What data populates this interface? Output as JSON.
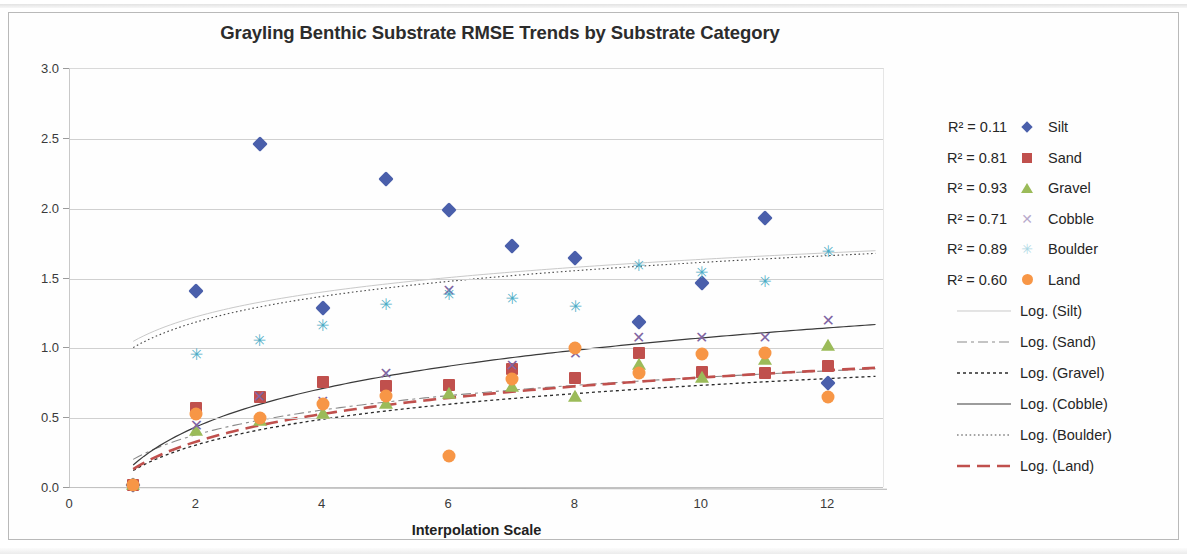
{
  "chart_data": {
    "type": "scatter",
    "title": "Grayling Benthic Substrate RMSE Trends by Substrate Category",
    "xlabel": "Interpolation Scale",
    "ylabel": "RMSE",
    "xlim": [
      0,
      12.9
    ],
    "ylim": [
      0.0,
      3.0
    ],
    "ytick_labels": [
      "0.0",
      "0.5",
      "1.0",
      "1.5",
      "2.0",
      "2.5",
      "3.0"
    ],
    "ytick_values": [
      0.0,
      0.5,
      1.0,
      1.5,
      2.0,
      2.5,
      3.0
    ],
    "xtick_labels": [
      "0",
      "2",
      "4",
      "6",
      "8",
      "10",
      "12"
    ],
    "xtick_values": [
      0,
      2,
      4,
      6,
      8,
      10,
      12
    ],
    "grid": true,
    "legend_position": "right",
    "x": [
      1,
      2,
      3,
      4,
      5,
      6,
      7,
      8,
      9,
      10,
      11,
      12
    ],
    "series": [
      {
        "name": "Silt",
        "marker": "diamond",
        "color": "#4A5FAB",
        "r2": "0.11",
        "r2_label": "R² = 0.11",
        "trend_label": "Log. (Silt)",
        "trend_style": "thin-solid-light",
        "trend_color": "#c9c9c9",
        "values": [
          0.02,
          1.41,
          2.46,
          1.29,
          2.21,
          1.99,
          1.73,
          1.65,
          1.19,
          1.47,
          1.93,
          0.75
        ]
      },
      {
        "name": "Sand",
        "marker": "square",
        "color": "#C0504D",
        "r2": "0.81",
        "r2_label": "R² = 0.81",
        "trend_label": "Log. (Sand)",
        "trend_style": "dash-dot",
        "trend_color": "#8a8a8a",
        "values": [
          0.02,
          0.57,
          0.65,
          0.76,
          0.73,
          0.74,
          0.85,
          0.79,
          0.97,
          0.83,
          0.82,
          0.87
        ]
      },
      {
        "name": "Gravel",
        "marker": "triangle",
        "color": "#9BBB59",
        "r2": "0.93",
        "r2_label": "R² = 0.93",
        "trend_label": "Log. (Gravel)",
        "trend_style": "dotted-dark",
        "trend_color": "#2b2b2b",
        "values": [
          0.02,
          0.41,
          0.48,
          0.53,
          0.6,
          0.67,
          0.72,
          0.65,
          0.88,
          0.79,
          0.92,
          1.02
        ]
      },
      {
        "name": "Cobble",
        "marker": "x",
        "color": "#8064A2",
        "r2": "0.71",
        "r2_label": "R² = 0.71",
        "trend_label": "Log. (Cobble)",
        "trend_style": "solid-dark",
        "trend_color": "#3a3a3a",
        "values": [
          0.02,
          0.45,
          0.66,
          0.62,
          0.82,
          1.42,
          0.88,
          0.97,
          1.08,
          1.08,
          1.08,
          1.2
        ]
      },
      {
        "name": "Boulder",
        "marker": "star",
        "color": "#4BACC6",
        "r2": "0.89",
        "r2_label": "R² = 0.89",
        "trend_label": "Log. (Boulder)",
        "trend_style": "fine-dotted",
        "trend_color": "#4a4a4a",
        "values": [
          0.02,
          0.96,
          1.06,
          1.17,
          1.32,
          1.39,
          1.36,
          1.3,
          1.6,
          1.55,
          1.48,
          1.7
        ]
      },
      {
        "name": "Land",
        "marker": "circle",
        "color": "#F79646",
        "r2": "0.60",
        "r2_label": "R² = 0.60",
        "trend_label": "Log. (Land)",
        "trend_style": "thick-dash-red",
        "trend_color": "#C0504D",
        "values": [
          0.02,
          0.53,
          0.5,
          0.6,
          0.66,
          0.23,
          0.78,
          1.0,
          0.82,
          0.96,
          0.97,
          0.65
        ]
      }
    ],
    "trendlines": [
      {
        "name": "Log. (Silt)",
        "a": 0.255,
        "b": 1.05,
        "color": "#c9c9c9",
        "width": 1.0,
        "dash": "none"
      },
      {
        "name": "Log. (Sand)",
        "a": 0.255,
        "b": 0.205,
        "color": "#8a8a8a",
        "width": 1.1,
        "dash": "10,4,3,4"
      },
      {
        "name": "Log. (Gravel)",
        "a": 0.265,
        "b": 0.125,
        "color": "#2b2b2b",
        "width": 1.3,
        "dash": "3,3"
      },
      {
        "name": "Log. (Cobble)",
        "a": 0.395,
        "b": 0.165,
        "color": "#3a3a3a",
        "width": 1.2,
        "dash": "none"
      },
      {
        "name": "Log. (Boulder)",
        "a": 0.265,
        "b": 1.005,
        "color": "#4a4a4a",
        "width": 1.1,
        "dash": "1.6,2.6"
      },
      {
        "name": "Log. (Land)",
        "a": 0.285,
        "b": 0.135,
        "color": "#C0504D",
        "width": 2.6,
        "dash": "13,7"
      }
    ]
  }
}
